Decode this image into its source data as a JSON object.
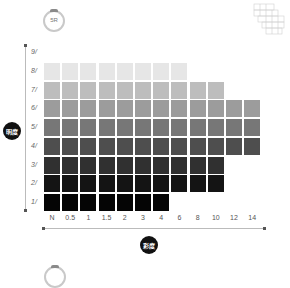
{
  "hue": {
    "top_label": "5R",
    "bottom_label": ""
  },
  "axes": {
    "value_label": "明度",
    "chroma_label": "彩度"
  },
  "chart_data": {
    "type": "heatmap",
    "title": "5R",
    "xlabel": "彩度",
    "ylabel": "明度",
    "x_ticks": [
      "N",
      "0.5",
      "1",
      "1.5",
      "2",
      "3",
      "4",
      "6",
      "8",
      "10",
      "12",
      "14"
    ],
    "y_ticks": [
      "9/",
      "8/",
      "7/",
      "6/",
      "5/",
      "4/",
      "3/",
      "2/",
      "1/"
    ],
    "rows": [
      {
        "value": "8/",
        "columns": 8,
        "color": "#e6e6e6"
      },
      {
        "value": "7/",
        "columns": 10,
        "color": "#bdbdbd"
      },
      {
        "value": "6/",
        "columns": 12,
        "color": "#9c9c9c"
      },
      {
        "value": "5/",
        "columns": 12,
        "color": "#777777"
      },
      {
        "value": "4/",
        "columns": 12,
        "color": "#4e4e4e"
      },
      {
        "value": "3/",
        "columns": 10,
        "color": "#303030"
      },
      {
        "value": "2/",
        "columns": 10,
        "color": "#141414"
      },
      {
        "value": "1/",
        "columns": 7,
        "color": "#050505"
      }
    ],
    "grid": false,
    "legend": "none"
  }
}
